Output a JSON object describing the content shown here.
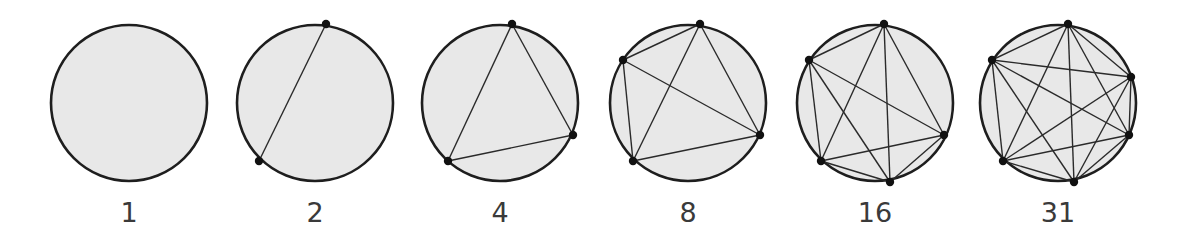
{
  "figure": {
    "colors": {
      "fill": "#e8e8e8",
      "stroke": "#1e1e1e",
      "chord": "#2a2a2a",
      "point": "#111111",
      "label": "#3a3a3a"
    },
    "radius": 78,
    "panels": [
      {
        "label": "1",
        "cx": 129,
        "cy": 103,
        "points": []
      },
      {
        "label": "2",
        "cx": 315,
        "cy": 103,
        "points": [
          [
            326,
            24
          ],
          [
            259,
            161
          ]
        ]
      },
      {
        "label": "4",
        "cx": 500,
        "cy": 103,
        "points": [
          [
            512,
            24
          ],
          [
            573,
            135
          ],
          [
            448,
            161
          ]
        ]
      },
      {
        "label": "8",
        "cx": 688,
        "cy": 103,
        "points": [
          [
            700,
            24
          ],
          [
            623,
            60
          ],
          [
            760,
            135
          ],
          [
            633,
            161
          ]
        ]
      },
      {
        "label": "16",
        "cx": 875,
        "cy": 103,
        "points": [
          [
            884,
            24
          ],
          [
            809,
            60
          ],
          [
            944,
            135
          ],
          [
            821,
            161
          ],
          [
            890,
            182
          ]
        ]
      },
      {
        "label": "31",
        "cx": 1058,
        "cy": 103,
        "points": [
          [
            1068,
            24
          ],
          [
            992,
            60
          ],
          [
            1131,
            77
          ],
          [
            1129,
            135
          ],
          [
            1003,
            161
          ],
          [
            1074,
            182
          ]
        ]
      }
    ]
  }
}
